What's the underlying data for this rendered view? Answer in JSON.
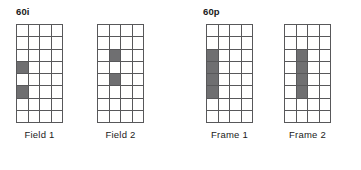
{
  "figure": {
    "title": "",
    "colors": {
      "grid_line": "#58585a",
      "cell_fill_on": "#6f6f71",
      "cell_fill_off": "#ffffff",
      "text": "#1a1a1a",
      "background": "#ffffff"
    }
  },
  "groups": [
    {
      "id": "interlaced",
      "title": "60i",
      "panels": [
        {
          "id": "field-1",
          "label": "Field 1",
          "columns": 4,
          "rows": 8,
          "shaded_cells": [
            {
              "row": 4,
              "col": 1
            },
            {
              "row": 6,
              "col": 1
            }
          ]
        },
        {
          "id": "field-2",
          "label": "Field 2",
          "columns": 4,
          "rows": 8,
          "shaded_cells": [
            {
              "row": 3,
              "col": 2
            },
            {
              "row": 5,
              "col": 2
            }
          ]
        }
      ]
    },
    {
      "id": "progressive",
      "title": "60p",
      "panels": [
        {
          "id": "frame-1",
          "label": "Frame 1",
          "columns": 4,
          "rows": 8,
          "shaded_cells": [
            {
              "row": 3,
              "col": 1
            },
            {
              "row": 4,
              "col": 1
            },
            {
              "row": 5,
              "col": 1
            },
            {
              "row": 6,
              "col": 1
            }
          ]
        },
        {
          "id": "frame-2",
          "label": "Frame 2",
          "columns": 4,
          "rows": 8,
          "shaded_cells": [
            {
              "row": 3,
              "col": 2
            },
            {
              "row": 4,
              "col": 2
            },
            {
              "row": 5,
              "col": 2
            },
            {
              "row": 6,
              "col": 2
            }
          ]
        }
      ]
    }
  ]
}
